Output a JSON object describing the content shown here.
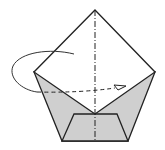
{
  "diagram": {
    "type": "origami-fold-step",
    "colors": {
      "background": "#ffffff",
      "stroke": "#222222",
      "fill_shaded": "#cfcfcf",
      "fill_white": "#ffffff"
    },
    "symbols": [
      "valley-fold-dashed-line",
      "mountain-fold-dash-dot-line",
      "fold-behind-curved-arrow"
    ]
  }
}
